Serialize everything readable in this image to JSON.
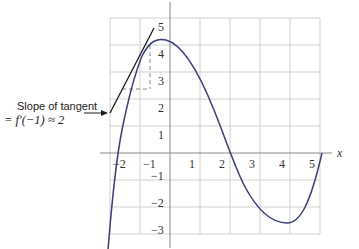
{
  "figure": {
    "axis_x_label": "x",
    "x_ticks": [
      "−2",
      "−1",
      "1",
      "2",
      "3",
      "4",
      "5"
    ],
    "y_ticks": [
      "5",
      "4",
      "3",
      "2",
      "1",
      "−1",
      "−2",
      "−3"
    ],
    "annotation": {
      "line1": "Slope of tangent",
      "line2": "= f′(−1) ≈ 2"
    },
    "colors": {
      "curve": "#3a3f7a",
      "grid": "#d0d0d0",
      "axis": "#888888",
      "tangent": "#1a1a1a",
      "dashed": "#888888"
    }
  }
}
